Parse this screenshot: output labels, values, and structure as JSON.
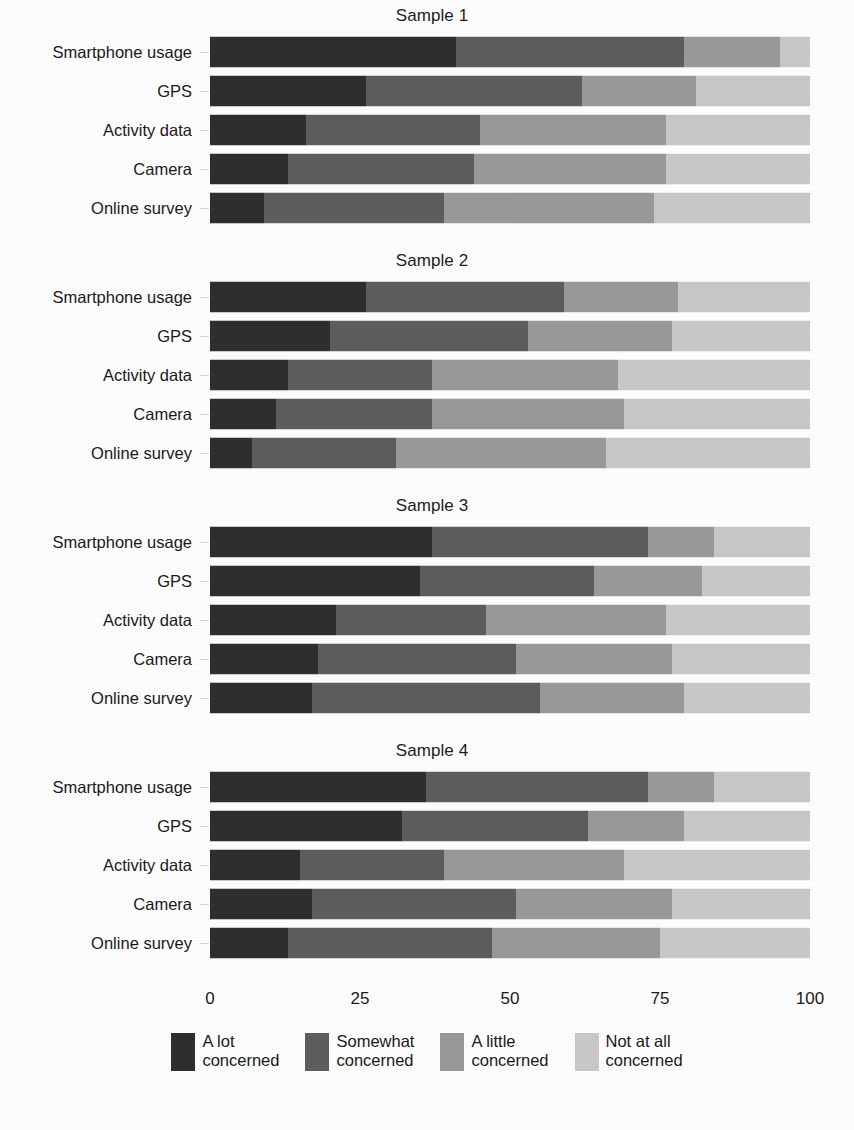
{
  "figure": {
    "categories_label": "",
    "axis": {
      "ticks": [
        "0",
        "25",
        "50",
        "75",
        "100"
      ],
      "tick_values": [
        0,
        25,
        50,
        75,
        100
      ],
      "min": 0,
      "max": 100
    },
    "colors": {
      "a_lot": "#2f2f2f",
      "somewhat": "#5e5e5e",
      "a_little": "#9a9a9a",
      "not_at_all": "#c9c9c9",
      "background": "#ffffff",
      "text": "#1a1a1a"
    },
    "legend": [
      {
        "label": "A lot\nconcerned",
        "color_key": "a_lot"
      },
      {
        "label": "Somewhat\nconcerned",
        "color_key": "somewhat"
      },
      {
        "label": "A little\nconcerned",
        "color_key": "a_little"
      },
      {
        "label": "Not at all\nconcerned",
        "color_key": "not_at_all"
      }
    ]
  },
  "chart_data": {
    "type": "bar",
    "subtype": "stacked-horizontal-100pct",
    "title": "",
    "xlabel": "",
    "ylabel": "",
    "xlim": [
      0,
      100
    ],
    "xticks": [
      0,
      25,
      50,
      75,
      100
    ],
    "grid": false,
    "legend_position": "bottom",
    "categories": [
      "Smartphone usage",
      "GPS",
      "Activity data",
      "Camera",
      "Online survey"
    ],
    "series_names": [
      "A lot concerned",
      "Somewhat concerned",
      "A little concerned",
      "Not at all concerned"
    ],
    "panels": [
      {
        "title": "Sample 1",
        "rows": [
          {
            "category": "Smartphone usage",
            "values": [
              41,
              38,
              16,
              5
            ]
          },
          {
            "category": "GPS",
            "values": [
              26,
              36,
              19,
              19
            ]
          },
          {
            "category": "Activity data",
            "values": [
              16,
              29,
              31,
              24
            ]
          },
          {
            "category": "Camera",
            "values": [
              13,
              31,
              32,
              24
            ]
          },
          {
            "category": "Online survey",
            "values": [
              9,
              30,
              35,
              26
            ]
          }
        ]
      },
      {
        "title": "Sample 2",
        "rows": [
          {
            "category": "Smartphone usage",
            "values": [
              26,
              33,
              19,
              22
            ]
          },
          {
            "category": "GPS",
            "values": [
              20,
              33,
              24,
              23
            ]
          },
          {
            "category": "Activity data",
            "values": [
              13,
              24,
              31,
              32
            ]
          },
          {
            "category": "Camera",
            "values": [
              11,
              26,
              32,
              31
            ]
          },
          {
            "category": "Online survey",
            "values": [
              7,
              24,
              35,
              34
            ]
          }
        ]
      },
      {
        "title": "Sample 3",
        "rows": [
          {
            "category": "Smartphone usage",
            "values": [
              37,
              36,
              11,
              16
            ]
          },
          {
            "category": "GPS",
            "values": [
              35,
              29,
              18,
              18
            ]
          },
          {
            "category": "Activity data",
            "values": [
              21,
              25,
              30,
              24
            ]
          },
          {
            "category": "Camera",
            "values": [
              18,
              33,
              26,
              23
            ]
          },
          {
            "category": "Online survey",
            "values": [
              17,
              38,
              24,
              21
            ]
          }
        ]
      },
      {
        "title": "Sample 4",
        "rows": [
          {
            "category": "Smartphone usage",
            "values": [
              36,
              37,
              11,
              16
            ]
          },
          {
            "category": "GPS",
            "values": [
              32,
              31,
              16,
              21
            ]
          },
          {
            "category": "Activity data",
            "values": [
              15,
              24,
              30,
              31
            ]
          },
          {
            "category": "Camera",
            "values": [
              17,
              34,
              26,
              23
            ]
          },
          {
            "category": "Online survey",
            "values": [
              13,
              34,
              28,
              25
            ]
          }
        ]
      }
    ]
  }
}
